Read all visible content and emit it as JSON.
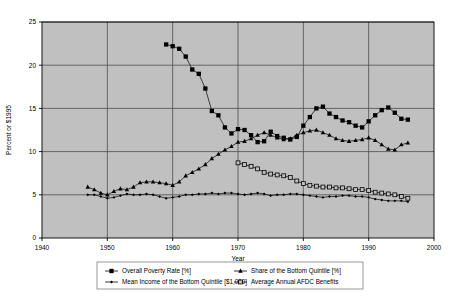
{
  "chart_data": {
    "type": "line",
    "title": "",
    "xlabel": "Year",
    "ylabel": "Percent or $1995",
    "xlim": [
      1940,
      2000
    ],
    "ylim": [
      0,
      25
    ],
    "xticks": [
      1940,
      1950,
      1960,
      1970,
      1980,
      1990,
      2000
    ],
    "yticks": [
      0,
      5,
      10,
      15,
      20,
      25
    ],
    "grid": true,
    "legend_position": "bottom",
    "plot_background": "#c0c0c0",
    "page_background": "#ffffff",
    "series": [
      {
        "name": "Overall Poverty Rate [%]",
        "marker": "filled-square",
        "color": "#000000",
        "x": [
          1959,
          1960,
          1961,
          1962,
          1963,
          1964,
          1965,
          1966,
          1967,
          1968,
          1969,
          1970,
          1971,
          1972,
          1973,
          1974,
          1975,
          1976,
          1977,
          1978,
          1979,
          1980,
          1981,
          1982,
          1983,
          1984,
          1985,
          1986,
          1987,
          1988,
          1989,
          1990,
          1991,
          1992,
          1993,
          1994,
          1995,
          1996
        ],
        "values": [
          22.4,
          22.2,
          21.9,
          21.0,
          19.5,
          19.0,
          17.3,
          14.7,
          14.2,
          12.8,
          12.1,
          12.6,
          12.5,
          11.9,
          11.1,
          11.2,
          12.3,
          11.8,
          11.6,
          11.4,
          11.7,
          13.0,
          14.0,
          15.0,
          15.2,
          14.4,
          14.0,
          13.6,
          13.4,
          13.0,
          12.8,
          13.5,
          14.2,
          14.8,
          15.1,
          14.5,
          13.8,
          13.7
        ]
      },
      {
        "name": "Share of the Bottom Quintile [%]",
        "marker": "filled-triangle",
        "color": "#000000",
        "x": [
          1947,
          1948,
          1949,
          1950,
          1951,
          1952,
          1953,
          1954,
          1955,
          1956,
          1957,
          1958,
          1959,
          1960,
          1961,
          1962,
          1963,
          1964,
          1965,
          1966,
          1967,
          1968,
          1969,
          1970,
          1971,
          1972,
          1973,
          1974,
          1975,
          1976,
          1977,
          1978,
          1979,
          1980,
          1981,
          1982,
          1983,
          1984,
          1985,
          1986,
          1987,
          1988,
          1989,
          1990,
          1991,
          1992,
          1993,
          1994,
          1995,
          1996
        ],
        "values": [
          5.9,
          5.6,
          5.2,
          5.0,
          5.4,
          5.7,
          5.6,
          5.9,
          6.4,
          6.5,
          6.5,
          6.4,
          6.3,
          6.1,
          6.5,
          7.2,
          7.6,
          8.0,
          8.5,
          9.2,
          9.7,
          10.2,
          10.6,
          11.1,
          11.2,
          11.5,
          11.9,
          12.2,
          11.9,
          11.6,
          11.4,
          11.5,
          11.9,
          12.2,
          12.4,
          12.5,
          12.2,
          11.9,
          11.5,
          11.3,
          11.2,
          11.3,
          11.4,
          11.6,
          11.3,
          10.8,
          10.3,
          10.2,
          10.8,
          11.0
        ]
      },
      {
        "name": "Mean Income of the Bottom Quintile [$1,000]",
        "marker": "filled-diamond",
        "color": "#000000",
        "x": [
          1947,
          1948,
          1949,
          1950,
          1951,
          1952,
          1953,
          1954,
          1955,
          1956,
          1957,
          1958,
          1959,
          1960,
          1961,
          1962,
          1963,
          1964,
          1965,
          1966,
          1967,
          1968,
          1969,
          1970,
          1971,
          1972,
          1973,
          1974,
          1975,
          1976,
          1977,
          1978,
          1979,
          1980,
          1981,
          1982,
          1983,
          1984,
          1985,
          1986,
          1987,
          1988,
          1989,
          1990,
          1991,
          1992,
          1993,
          1994,
          1995,
          1996
        ],
        "values": [
          5.0,
          5.0,
          4.8,
          4.6,
          4.7,
          4.9,
          5.1,
          5.0,
          5.0,
          5.1,
          5.0,
          4.8,
          4.6,
          4.7,
          4.8,
          5.0,
          5.0,
          5.1,
          5.1,
          5.2,
          5.1,
          5.2,
          5.2,
          5.1,
          5.0,
          5.1,
          5.2,
          5.1,
          4.9,
          5.0,
          5.0,
          5.1,
          5.1,
          5.0,
          4.9,
          4.8,
          4.7,
          4.8,
          4.8,
          4.9,
          4.9,
          4.8,
          4.8,
          4.7,
          4.5,
          4.4,
          4.3,
          4.3,
          4.3,
          4.2
        ]
      },
      {
        "name": "Average Annual AFDC Benefits",
        "marker": "open-square",
        "color": "#000000",
        "x": [
          1970,
          1971,
          1972,
          1973,
          1974,
          1975,
          1976,
          1977,
          1978,
          1979,
          1980,
          1981,
          1982,
          1983,
          1984,
          1985,
          1986,
          1987,
          1988,
          1989,
          1990,
          1991,
          1992,
          1993,
          1994,
          1995,
          1996
        ],
        "values": [
          8.7,
          8.5,
          8.3,
          8.0,
          7.6,
          7.4,
          7.3,
          7.2,
          7.0,
          6.6,
          6.3,
          6.1,
          6.0,
          5.9,
          5.9,
          5.8,
          5.8,
          5.7,
          5.6,
          5.6,
          5.5,
          5.3,
          5.2,
          5.1,
          5.0,
          4.8,
          4.6
        ]
      }
    ]
  },
  "axis": {
    "ylabel": "Percent or $1995",
    "xlabel": "Year"
  }
}
